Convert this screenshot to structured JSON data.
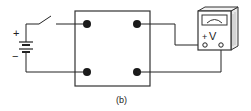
{
  "diagram": {
    "caption": "(b)",
    "battery": {
      "plus_label": "+",
      "minus_label": "−"
    },
    "voltmeter": {
      "polarity_label": "+",
      "unit_label": "V"
    },
    "box": {
      "terminals": [
        "top-left",
        "bottom-left",
        "top-right",
        "bottom-right"
      ]
    },
    "colors": {
      "line": "#222222",
      "terminal": "#1a1a1a",
      "background": "#ffffff"
    }
  }
}
